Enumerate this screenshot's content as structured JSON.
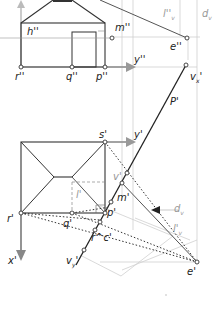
{
  "diagram": {
    "type": "descriptive-geometry-perspective-construction",
    "views": {
      "front": {
        "labels": {
          "h": "h''",
          "m": "m''",
          "e": "e''",
          "r": "r''",
          "q": "q''",
          "p": "p''",
          "y": "y''",
          "l": "l''",
          "l_sub": "v",
          "d": "d",
          "d_sub": "v"
        }
      },
      "top": {
        "labels": {
          "s": "s'",
          "y": "y'",
          "r": "r'",
          "q": "q'",
          "p": "p'",
          "m": "m'",
          "e": "e'",
          "x": "x'",
          "P": "P'",
          "v_top": "v",
          "v_top_sub": "x",
          "v_top_prime": "'",
          "v_bottom": "v",
          "v_bottom_sub": "y",
          "v_bottom_prime": "'",
          "v_mid": "v'",
          "l": "l'",
          "l_sub": "v",
          "d": "d",
          "d_sub": "v",
          "r_c": "r^c'"
        }
      }
    },
    "colors": {
      "line_dark": "#222222",
      "line_mid": "#555555",
      "line_light": "#cccccc",
      "axis_arrow": "#888888",
      "label_gray": "#999999"
    }
  }
}
